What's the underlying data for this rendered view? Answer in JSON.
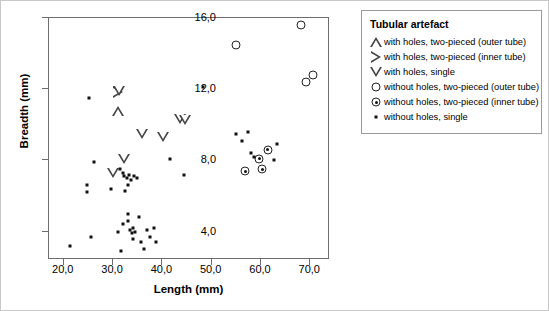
{
  "chart_data": {
    "type": "scatter",
    "title": "",
    "xlabel": "Length (mm)",
    "ylabel": "Breadth (mm)",
    "xlim": [
      17.0,
      74.0
    ],
    "ylim": [
      2.4,
      16.0
    ],
    "xticks": [
      "20,0",
      "30,0",
      "40,0",
      "50,0",
      "60,0",
      "70,0"
    ],
    "xtick_values": [
      20.0,
      30.0,
      40.0,
      50.0,
      60.0,
      70.0
    ],
    "yticks": [
      "16,0",
      "12,0",
      "8,0",
      "4,0"
    ],
    "ytick_values": [
      16.0,
      12.0,
      8.0,
      4.0
    ],
    "grid": false,
    "legend_position": "right-outside",
    "series": [
      {
        "name": "with holes, two-pieced (outer tube)",
        "marker": "triangle-up",
        "points": [
          [
            31.0,
            10.8
          ]
        ]
      },
      {
        "name": "with holes, two-pieced (inner tube)",
        "marker": "triangle-right",
        "points": [
          [
            30.9,
            11.85
          ]
        ]
      },
      {
        "name": "with holes, single",
        "marker": "triangle-down",
        "points": [
          [
            31.1,
            11.9
          ],
          [
            32.2,
            8.1
          ],
          [
            29.9,
            7.3
          ],
          [
            35.8,
            9.5
          ],
          [
            40.2,
            9.3
          ],
          [
            43.6,
            10.3
          ],
          [
            44.6,
            10.25
          ]
        ]
      },
      {
        "name": "without holes, two-pieced (outer tube)",
        "marker": "circle",
        "points": [
          [
            68.2,
            15.6
          ],
          [
            55.0,
            14.5
          ],
          [
            69.1,
            12.4
          ],
          [
            70.6,
            12.8
          ]
        ]
      },
      {
        "name": "without holes, two-pieced (inner tube)",
        "marker": "circle-dot",
        "points": [
          [
            61.4,
            8.6
          ],
          [
            59.6,
            8.1
          ],
          [
            56.8,
            7.4
          ],
          [
            60.2,
            7.5
          ]
        ]
      },
      {
        "name": "without holes, single",
        "marker": "square",
        "points": [
          [
            21.3,
            3.2
          ],
          [
            25.6,
            3.7
          ],
          [
            25.1,
            11.5
          ],
          [
            26.2,
            7.9
          ],
          [
            24.6,
            6.6
          ],
          [
            24.6,
            6.2
          ],
          [
            29.6,
            6.4
          ],
          [
            31.4,
            7.5
          ],
          [
            31.9,
            7.3
          ],
          [
            32.3,
            7.1
          ],
          [
            32.8,
            7.0
          ],
          [
            33.2,
            7.2
          ],
          [
            33.6,
            6.9
          ],
          [
            33.1,
            6.6
          ],
          [
            34.3,
            7.1
          ],
          [
            34.9,
            7.0
          ],
          [
            32.5,
            6.3
          ],
          [
            31.0,
            4.0
          ],
          [
            32.0,
            4.4
          ],
          [
            33.1,
            4.6
          ],
          [
            33.4,
            4.1
          ],
          [
            33.8,
            3.9
          ],
          [
            34.0,
            4.2
          ],
          [
            34.4,
            4.0
          ],
          [
            34.0,
            3.6
          ],
          [
            33.0,
            5.0
          ],
          [
            35.2,
            4.8
          ],
          [
            35.6,
            3.4
          ],
          [
            36.8,
            4.1
          ],
          [
            37.5,
            3.7
          ],
          [
            38.2,
            4.2
          ],
          [
            38.6,
            3.4
          ],
          [
            36.3,
            3.0
          ],
          [
            31.6,
            2.9
          ],
          [
            41.6,
            8.1
          ],
          [
            44.4,
            7.2
          ],
          [
            48.3,
            12.1
          ],
          [
            54.9,
            9.5
          ],
          [
            56.2,
            9.1
          ],
          [
            57.3,
            9.6
          ],
          [
            58.0,
            8.4
          ],
          [
            58.6,
            8.2
          ],
          [
            63.2,
            8.9
          ],
          [
            62.6,
            8.0
          ]
        ]
      }
    ]
  },
  "legend": {
    "title": "Tubular artefact",
    "items": [
      {
        "symbol": "triangle-up-icon",
        "label": "with holes, two-pieced (outer tube)"
      },
      {
        "symbol": "triangle-right-icon",
        "label": "with holes, two-pieced (inner tube)"
      },
      {
        "symbol": "triangle-down-icon",
        "label": "with holes, single"
      },
      {
        "symbol": "circle-icon",
        "label": "without holes, two-pieced (outer tube)"
      },
      {
        "symbol": "circle-dot-icon",
        "label": "without holes, two-pieced (inner tube)"
      },
      {
        "symbol": "square-icon",
        "label": "without holes, single"
      }
    ]
  }
}
